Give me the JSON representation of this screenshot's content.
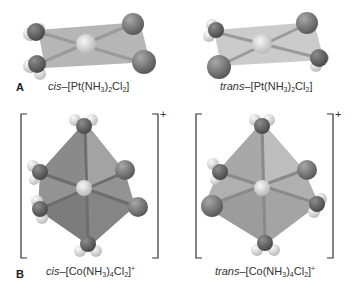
{
  "panels": {
    "A": {
      "label": "A",
      "molecules": [
        {
          "id": "cis-pt",
          "prefix": "cis",
          "formula_parts": [
            "–[Pt(NH",
            "3",
            ")",
            "2",
            "Cl",
            "2",
            "]"
          ],
          "geometry": "square-planar"
        },
        {
          "id": "trans-pt",
          "prefix": "trans",
          "formula_parts": [
            "–[Pt(NH",
            "3",
            ")",
            "2",
            "Cl",
            "2",
            "]"
          ],
          "geometry": "square-planar"
        }
      ]
    },
    "B": {
      "label": "B",
      "molecules": [
        {
          "id": "cis-co",
          "prefix": "cis",
          "formula_parts": [
            "–[Co(NH",
            "3",
            ")",
            "4",
            "Cl",
            "2",
            "]"
          ],
          "charge": "+",
          "geometry": "octahedral"
        },
        {
          "id": "trans-co",
          "prefix": "trans",
          "formula_parts": [
            "–[Co(NH",
            "3",
            ")",
            "4",
            "Cl",
            "2",
            "]"
          ],
          "charge": "+",
          "geometry": "octahedral"
        }
      ]
    }
  },
  "colors": {
    "plane": "#9a9a9a",
    "plane_light": "#c4c4c4",
    "metal": "#d8d8d8",
    "chlorine": "#777777",
    "nitrogen": "#5e5e5e",
    "hydrogen": "#e8e8e8",
    "bond": "#8a8a8a",
    "octahedron_dark": "#8f8f8f",
    "octahedron_light": "#b0b0b0"
  }
}
